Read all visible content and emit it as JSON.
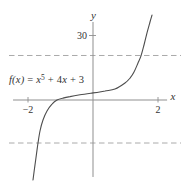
{
  "figure": {
    "annotation": {
      "fx": "f(x)",
      "eq": " = ",
      "var1": "x",
      "exp": "5",
      "mid": " + 4",
      "var2": "x",
      "end": " + 3"
    },
    "colors": {
      "axis": "#8f8f8f",
      "dashed": "#a0a0a0",
      "curve": "#4d4d4d",
      "text": "#333333"
    }
  },
  "chart_data": {
    "type": "line",
    "title": "",
    "expression": "f(x) = x^5 + 4x + 3",
    "xlabel": "x",
    "ylabel": "y",
    "xlim": [
      -2.46,
      2.28
    ],
    "ylim": [
      -35.8,
      36.3
    ],
    "grid": false,
    "x_ticks": [
      {
        "value": -2,
        "label": "−2"
      },
      {
        "value": 2,
        "label": "2"
      }
    ],
    "y_ticks": [
      {
        "value": 30,
        "label": "30"
      }
    ],
    "guide_lines_y": [
      20.7,
      -20
    ],
    "series": [
      {
        "name": "f(x) = x^5 + 4x + 3",
        "points": [
          [
            -1.846,
            -37.2
          ],
          [
            -1.785,
            -30.2
          ],
          [
            -1.723,
            -23.3
          ],
          [
            -1.692,
            -20.0
          ],
          [
            -1.631,
            -14.4
          ],
          [
            -1.538,
            -9.3
          ],
          [
            -1.415,
            -5.1
          ],
          [
            -1.262,
            -1.9
          ],
          [
            -1.108,
            0.0
          ],
          [
            -0.923,
            0.9
          ],
          [
            -0.708,
            1.6
          ],
          [
            -0.4,
            2.4
          ],
          [
            0.0,
            3.3
          ],
          [
            0.369,
            4.2
          ],
          [
            0.677,
            5.1
          ],
          [
            0.985,
            7.9
          ],
          [
            1.138,
            10.2
          ],
          [
            1.262,
            13.0
          ],
          [
            1.385,
            17.2
          ],
          [
            1.477,
            20.5
          ],
          [
            1.569,
            25.6
          ],
          [
            1.662,
            31.2
          ],
          [
            1.754,
            36.3
          ],
          [
            1.815,
            39.5
          ]
        ]
      }
    ]
  }
}
